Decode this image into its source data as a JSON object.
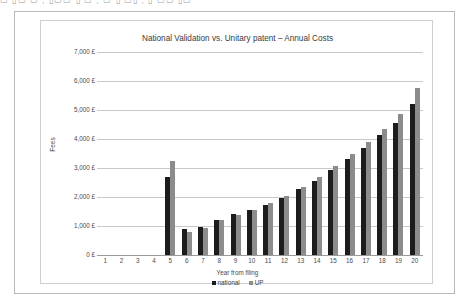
{
  "top_strip": {
    "text": "▭ ▯▭  ▭ ,  ▯▭▭ ▯ ▭ , ▭ ▯ ▭▯ ,  ▯ ▭▭  ▯▭"
  },
  "chart_data": {
    "type": "bar",
    "title": "National Validation vs. Unitary patent – Annual Costs",
    "xlabel": "Year from filing",
    "ylabel": "Fees",
    "ylim": [
      0,
      7000
    ],
    "ytick_values": [
      0,
      1000,
      2000,
      3000,
      4000,
      5000,
      6000,
      7000
    ],
    "ytick_labels": [
      "0 £",
      "1,000 £",
      "2,000 £",
      "3,000 £",
      "4,000 £",
      "5,000 £",
      "6,000 £",
      "7,000 £"
    ],
    "grid": true,
    "legend_position": "bottom",
    "categories": [
      "1",
      "2",
      "3",
      "4",
      "5",
      "6",
      "7",
      "8",
      "9",
      "10",
      "11",
      "12",
      "13",
      "14",
      "15",
      "16",
      "17",
      "18",
      "19",
      "20"
    ],
    "series": [
      {
        "name": "national",
        "color": "#1c1c1c",
        "values": [
          0,
          0,
          0,
          0,
          2700,
          880,
          960,
          1220,
          1420,
          1560,
          1720,
          1980,
          2260,
          2560,
          2940,
          3300,
          3700,
          4130,
          4560,
          5200
        ]
      },
      {
        "name": "UP",
        "color": "#8c8c8c",
        "values": [
          0,
          0,
          0,
          0,
          3250,
          790,
          930,
          1200,
          1380,
          1540,
          1800,
          2040,
          2340,
          2680,
          3080,
          3480,
          3900,
          4360,
          4850,
          5750
        ]
      }
    ]
  }
}
